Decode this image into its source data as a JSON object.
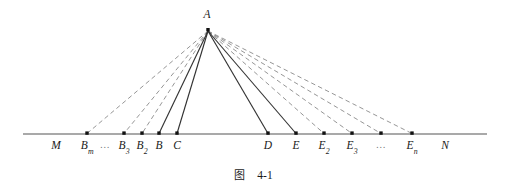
{
  "figure": {
    "caption_cjk": "图",
    "caption_number": "4-1",
    "apex": {
      "label": "A",
      "x": 208,
      "y": 29,
      "label_x": 207,
      "label_y": 15
    },
    "baseline": {
      "y": 134,
      "x_start": 23,
      "x_end": 487,
      "color": "#555555"
    },
    "endpoint_labels": [
      {
        "name": "M",
        "text": "M",
        "sub": "",
        "x": 56,
        "has_dot": false
      },
      {
        "name": "N",
        "text": "N",
        "sub": "",
        "x": 445,
        "has_dot": false
      }
    ],
    "points": [
      {
        "name": "B-m",
        "text": "B",
        "sub": "m",
        "x": 87,
        "has_dot": true,
        "ray": "dashed"
      },
      {
        "name": "left-ellipsis",
        "text": "…",
        "sub": "",
        "x": 105,
        "has_dot": false,
        "ray": "none"
      },
      {
        "name": "B-3",
        "text": "B",
        "sub": "3",
        "x": 124,
        "has_dot": true,
        "ray": "dashed"
      },
      {
        "name": "B-2",
        "text": "B",
        "sub": "2",
        "x": 142,
        "has_dot": true,
        "ray": "dashed"
      },
      {
        "name": "B",
        "text": "B",
        "sub": "",
        "x": 159,
        "has_dot": true,
        "ray": "solid"
      },
      {
        "name": "C",
        "text": "C",
        "sub": "",
        "x": 177,
        "has_dot": true,
        "ray": "solid"
      },
      {
        "name": "D",
        "text": "D",
        "sub": "",
        "x": 268,
        "has_dot": true,
        "ray": "solid"
      },
      {
        "name": "E",
        "text": "E",
        "sub": "",
        "x": 296,
        "has_dot": true,
        "ray": "solid"
      },
      {
        "name": "E-2",
        "text": "E",
        "sub": "2",
        "x": 324,
        "has_dot": true,
        "ray": "dashed"
      },
      {
        "name": "E-3",
        "text": "E",
        "sub": "3",
        "x": 352,
        "has_dot": true,
        "ray": "dashed"
      },
      {
        "name": "right-ellipsis",
        "text": "…",
        "sub": "",
        "x": 381,
        "has_dot": true,
        "ray": "dashed"
      },
      {
        "name": "E-n",
        "text": "E",
        "sub": "n",
        "x": 412,
        "has_dot": true,
        "ray": "dashed"
      }
    ],
    "label_y": 140,
    "colors": {
      "solid_ray": "#333333",
      "dashed_ray": "#8a8a8a",
      "axis": "#555555",
      "dot": "#111111",
      "text": "#1a1a1a"
    }
  }
}
